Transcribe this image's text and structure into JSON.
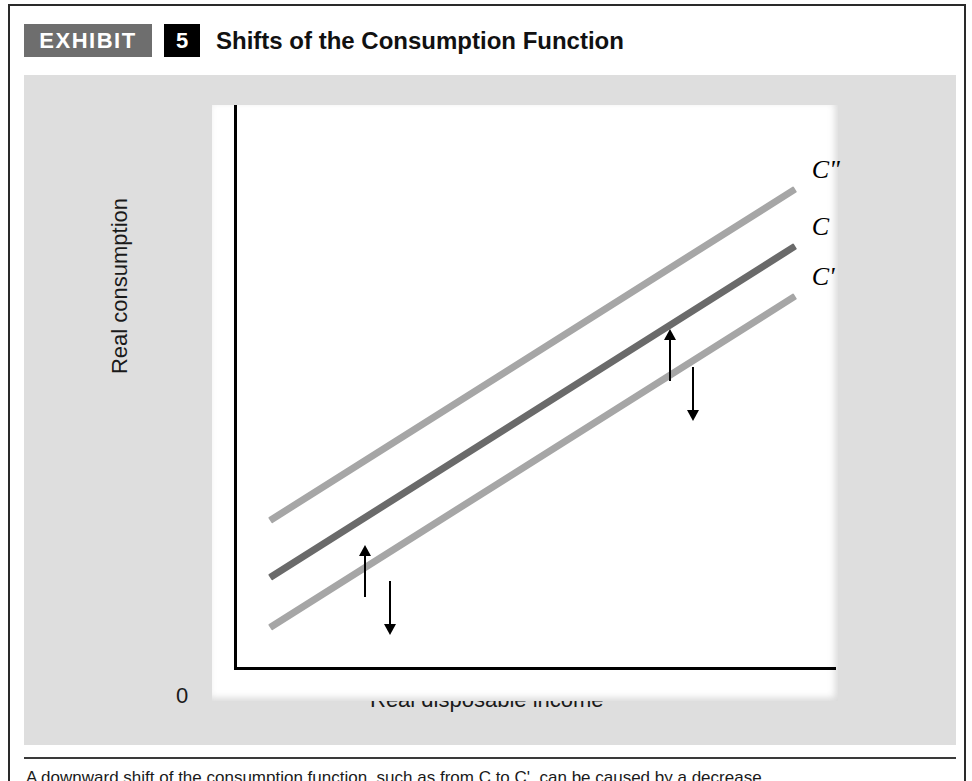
{
  "header": {
    "exhibit_tag": "EXHIBIT",
    "exhibit_number": "5",
    "title": "Shifts of the Consumption Function"
  },
  "chart_data": {
    "type": "line",
    "title": "Shifts of the Consumption Function",
    "xlabel": "Real disposable income",
    "ylabel": "Real consumption",
    "origin_label": "0",
    "grid": false,
    "axis_ticks": [],
    "legend_position": "right-of-line-ends",
    "series": [
      {
        "name": "C\"",
        "label": "C\"",
        "description": "upward-shifted consumption function",
        "color": "#a6a6a6",
        "x": [
          0.06,
          0.93
        ],
        "y": [
          0.26,
          0.85
        ]
      },
      {
        "name": "C",
        "label": "C",
        "description": "original consumption function",
        "color": "#6a6a6a",
        "x": [
          0.06,
          0.93
        ],
        "y": [
          0.16,
          0.75
        ]
      },
      {
        "name": "C'",
        "label": "C'",
        "description": "downward-shifted consumption function",
        "color": "#a6a6a6",
        "x": [
          0.06,
          0.93
        ],
        "y": [
          0.07,
          0.66
        ]
      }
    ],
    "annotations": [
      {
        "name": "shift-up-arrow-left",
        "direction": "up",
        "meaning": "upward shift from C to C\""
      },
      {
        "name": "shift-down-arrow-left",
        "direction": "down",
        "meaning": "downward shift from C to C'"
      },
      {
        "name": "shift-up-arrow-right",
        "direction": "up",
        "meaning": "upward shift from C to C\""
      },
      {
        "name": "shift-down-arrow-right",
        "direction": "down",
        "meaning": "downward shift from C to C'"
      }
    ]
  },
  "caption": {
    "text": "A downward shift of the consumption function, such as from C to C', can be caused by a decrease"
  },
  "colors": {
    "panel_background": "#dedede",
    "plot_background": "#ffffff",
    "line_light": "#a6a6a6",
    "line_dark": "#6a6a6a",
    "tag_background": "#6e6e6e",
    "number_background": "#000000",
    "axis": "#000000"
  }
}
